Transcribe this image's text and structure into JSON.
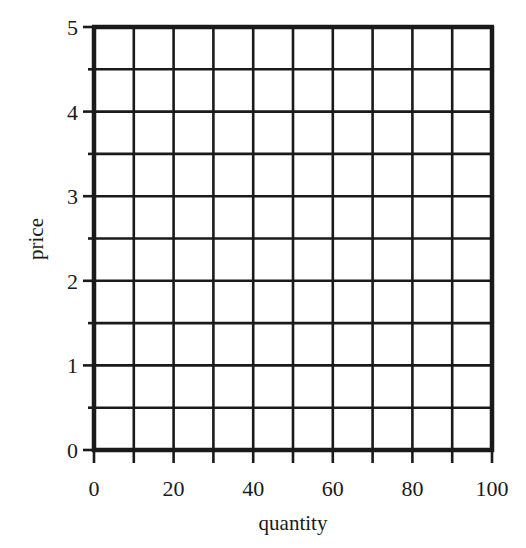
{
  "chart_data": {
    "type": "scatter",
    "title": "",
    "xlabel": "quantity",
    "ylabel": "price",
    "xlim": [
      0,
      100
    ],
    "ylim": [
      0,
      5
    ],
    "x_ticks": [
      0,
      20,
      40,
      60,
      80,
      100
    ],
    "x_tick_labels": [
      "0",
      "20",
      "40",
      "60",
      "80",
      "100"
    ],
    "y_ticks": [
      0,
      1,
      2,
      3,
      4,
      5
    ],
    "y_tick_labels": [
      "0",
      "1",
      "2",
      "3",
      "4",
      "5"
    ],
    "x_minor_ticks": [
      10,
      30,
      50,
      70,
      90
    ],
    "y_minor_ticks": [
      0.5,
      1.5,
      2.5,
      3.5,
      4.5
    ],
    "grid": true,
    "grid_x_step": 10,
    "grid_y_step": 0.5,
    "series": [],
    "legend": null
  },
  "colors": {
    "line": "#1a1a1a",
    "background": "#ffffff"
  }
}
